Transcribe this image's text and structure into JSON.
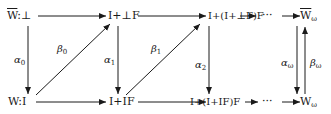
{
  "diagram": {
    "top_row": {
      "n0": "W",
      "n0_suffix": ":⊥",
      "n1": "I+⊥F",
      "n2": "I+(I+⊥F)F",
      "dots": "···",
      "n_omega": "W",
      "n_omega_sub": "ω"
    },
    "bottom_row": {
      "n0": "W:I",
      "n1": "I+IF",
      "n2": "I+(I+IF)F",
      "dots": "···",
      "n_omega": "W",
      "n_omega_sub": "ω"
    },
    "vertical_labels": {
      "alpha0": "α",
      "alpha0_sub": "0",
      "alpha1": "α",
      "alpha1_sub": "1",
      "alpha2": "α",
      "alpha2_sub": "2",
      "alpha_omega": "α",
      "alpha_omega_sub": "ω",
      "beta_omega": "β",
      "beta_omega_sub": "ω"
    },
    "diagonal_labels": {
      "beta0": "β",
      "beta0_sub": "0",
      "beta1": "β",
      "beta1_sub": "1"
    }
  }
}
